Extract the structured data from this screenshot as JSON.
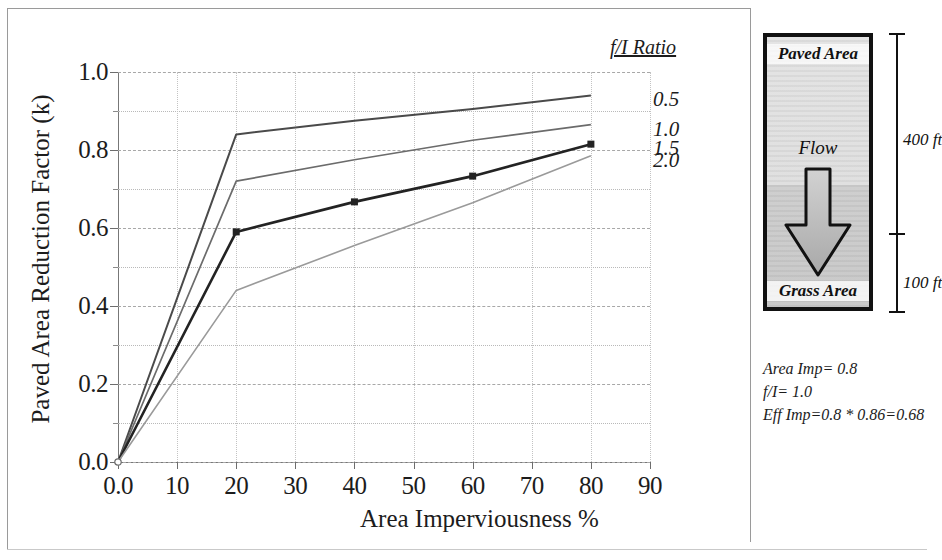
{
  "chart_data": {
    "type": "line",
    "title": "",
    "xlabel": "Area Imperviousness %",
    "ylabel": "Paved Area Reduction Factor (k)",
    "xlim": [
      0,
      90
    ],
    "ylim": [
      0.0,
      1.0
    ],
    "grid": true,
    "legend_position": "right",
    "legend_title": "f/I Ratio",
    "x_ticks": [
      "0.0",
      "10",
      "20",
      "30",
      "40",
      "50",
      "60",
      "70",
      "80",
      "90"
    ],
    "x_tick_values": [
      0,
      10,
      20,
      30,
      40,
      50,
      60,
      70,
      80,
      90
    ],
    "y_ticks": [
      "0.0",
      "0.2",
      "0.4",
      "0.6",
      "0.8",
      "1.0"
    ],
    "y_tick_values": [
      0.0,
      0.2,
      0.4,
      0.6,
      0.8,
      1.0
    ],
    "y_minor_ticks": [
      0.1,
      0.3,
      0.5,
      0.7,
      0.9
    ],
    "x": [
      0,
      20,
      40,
      60,
      80
    ],
    "series": [
      {
        "name": "0.5",
        "values": [
          0.0,
          0.84,
          0.875,
          0.905,
          0.94
        ]
      },
      {
        "name": "1.0",
        "values": [
          0.0,
          0.72,
          0.775,
          0.825,
          0.865
        ]
      },
      {
        "name": "1.5",
        "values": [
          0.0,
          0.59,
          0.667,
          0.733,
          0.815
        ]
      },
      {
        "name": "2.0",
        "values": [
          0.0,
          0.44,
          0.555,
          0.665,
          0.785
        ]
      }
    ]
  },
  "legend": {
    "title": "f/I Ratio",
    "entries": [
      {
        "label": "0.5"
      },
      {
        "label": "1.0"
      },
      {
        "label": "1.5"
      },
      {
        "label": "2.0"
      }
    ]
  },
  "diagram": {
    "paved_label": "Paved Area",
    "flow_label": "Flow",
    "grass_label": "Grass Area",
    "dim_top_label": "400 ft",
    "dim_bottom_label": "100 ft",
    "notes": [
      "Area Imp= 0.8",
      "f/I= 1.0",
      "Eff Imp=0.8 * 0.86=0.68"
    ]
  }
}
